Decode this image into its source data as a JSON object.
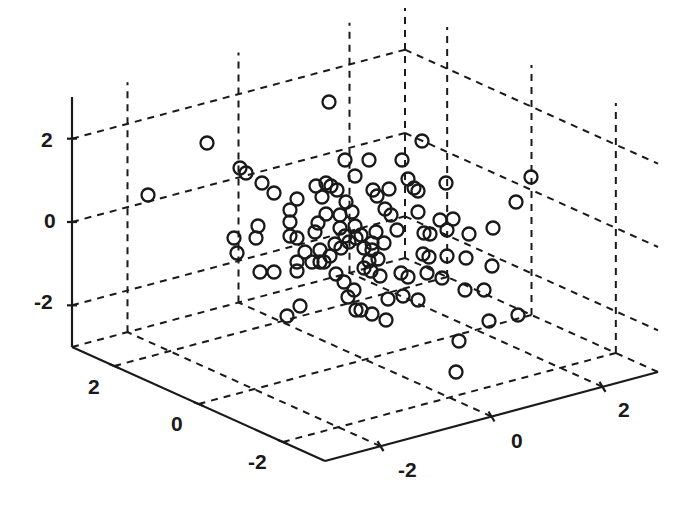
{
  "chart_data": {
    "type": "scatter3d",
    "title": "",
    "xlabel": "",
    "ylabel": "",
    "zlabel": "",
    "marker": "open-circle",
    "grid": true,
    "x_ticks": [
      "-2",
      "0",
      "2"
    ],
    "y_ticks": [
      "2",
      "0",
      "-2"
    ],
    "z_ticks": [
      "2",
      "0",
      "-2"
    ],
    "xlim": [
      -3,
      3
    ],
    "ylim": [
      -3,
      3
    ],
    "zlim": [
      -3,
      3
    ],
    "points_screen": [
      [
        329,
        102
      ],
      [
        207,
        143
      ],
      [
        422,
        141
      ],
      [
        148,
        195
      ],
      [
        240,
        168
      ],
      [
        246,
        173
      ],
      [
        262,
        183
      ],
      [
        274,
        193
      ],
      [
        345,
        160
      ],
      [
        369,
        160
      ],
      [
        402,
        160
      ],
      [
        316,
        186
      ],
      [
        326,
        183
      ],
      [
        331,
        186
      ],
      [
        337,
        190
      ],
      [
        355,
        176
      ],
      [
        373,
        190
      ],
      [
        377,
        196
      ],
      [
        389,
        189
      ],
      [
        408,
        179
      ],
      [
        414,
        188
      ],
      [
        418,
        191
      ],
      [
        446,
        183
      ],
      [
        531,
        177
      ],
      [
        516,
        202
      ],
      [
        297,
        199
      ],
      [
        290,
        210
      ],
      [
        290,
        222
      ],
      [
        290,
        236
      ],
      [
        297,
        238
      ],
      [
        258,
        226
      ],
      [
        256,
        238
      ],
      [
        234,
        238
      ],
      [
        237,
        253
      ],
      [
        260,
        272
      ],
      [
        274,
        272
      ],
      [
        297,
        271
      ],
      [
        297,
        262
      ],
      [
        315,
        232
      ],
      [
        326,
        214
      ],
      [
        352,
        212
      ],
      [
        340,
        228
      ],
      [
        345,
        236
      ],
      [
        335,
        244
      ],
      [
        320,
        250
      ],
      [
        320,
        262
      ],
      [
        330,
        256
      ],
      [
        341,
        248
      ],
      [
        349,
        242
      ],
      [
        356,
        238
      ],
      [
        361,
        235
      ],
      [
        364,
        248
      ],
      [
        372,
        250
      ],
      [
        378,
        259
      ],
      [
        369,
        261
      ],
      [
        376,
        232
      ],
      [
        384,
        243
      ],
      [
        391,
        215
      ],
      [
        385,
        209
      ],
      [
        397,
        230
      ],
      [
        418,
        212
      ],
      [
        424,
        233
      ],
      [
        430,
        234
      ],
      [
        440,
        220
      ],
      [
        453,
        219
      ],
      [
        447,
        230
      ],
      [
        469,
        234
      ],
      [
        493,
        228
      ],
      [
        423,
        254
      ],
      [
        429,
        257
      ],
      [
        447,
        256
      ],
      [
        466,
        258
      ],
      [
        492,
        266
      ],
      [
        427,
        273
      ],
      [
        442,
        278
      ],
      [
        465,
        290
      ],
      [
        484,
        290
      ],
      [
        489,
        321
      ],
      [
        518,
        315
      ],
      [
        459,
        341
      ],
      [
        456,
        372
      ],
      [
        418,
        300
      ],
      [
        388,
        299
      ],
      [
        386,
        320
      ],
      [
        372,
        314
      ],
      [
        361,
        310
      ],
      [
        356,
        310
      ],
      [
        348,
        297
      ],
      [
        354,
        290
      ],
      [
        344,
        282
      ],
      [
        336,
        274
      ],
      [
        300,
        306
      ],
      [
        287,
        316
      ],
      [
        401,
        273
      ],
      [
        408,
        277
      ],
      [
        403,
        296
      ],
      [
        380,
        276
      ],
      [
        371,
        271
      ],
      [
        340,
        215
      ],
      [
        318,
        223
      ],
      [
        346,
        202
      ],
      [
        322,
        197
      ],
      [
        305,
        252
      ],
      [
        312,
        262
      ],
      [
        324,
        262
      ],
      [
        355,
        226
      ],
      [
        372,
        243
      ],
      [
        364,
        268
      ]
    ]
  },
  "axes": {
    "z_tick_labels": [
      "2",
      "0",
      "-2"
    ],
    "left_tick_labels": [
      "2",
      "0",
      "-2"
    ],
    "right_tick_labels": [
      "-2",
      "0",
      "2"
    ]
  }
}
